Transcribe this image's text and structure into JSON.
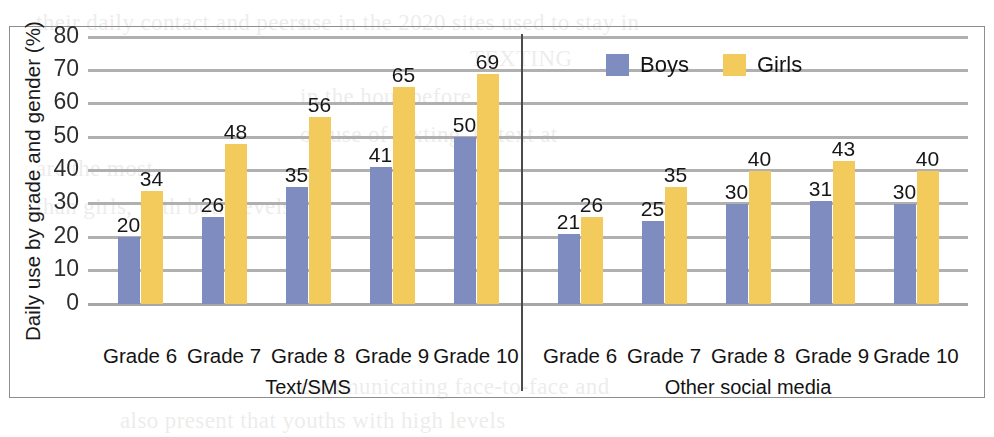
{
  "chart_data": {
    "type": "bar",
    "title": "",
    "xlabel": "",
    "ylabel": "Daily use by grade and gender (%)",
    "ylim": [
      0,
      80
    ],
    "ytick_step": 10,
    "yticks": [
      "80",
      "70",
      "60",
      "50",
      "40",
      "30",
      "20",
      "10",
      "0"
    ],
    "grid": true,
    "legend_position": "top-right",
    "categories": [
      "Grade 6",
      "Grade 7",
      "Grade 8",
      "Grade 9",
      "Grade 10"
    ],
    "panels": [
      {
        "label": "Text/SMS",
        "series": [
          {
            "name": "Boys",
            "color": "#7f8cbf",
            "values": [
              20,
              26,
              35,
              41,
              50
            ]
          },
          {
            "name": "Girls",
            "color": "#f3cb5d",
            "values": [
              34,
              48,
              56,
              65,
              69
            ]
          }
        ]
      },
      {
        "label": "Other social media",
        "series": [
          {
            "name": "Boys",
            "color": "#7f8cbf",
            "values": [
              21,
              25,
              30,
              31,
              30
            ]
          },
          {
            "name": "Girls",
            "color": "#f3cb5d",
            "values": [
              26,
              35,
              40,
              43,
              40
            ]
          }
        ]
      }
    ],
    "series_names": [
      "Boys",
      "Girls"
    ],
    "colors": {
      "boys": "#7f8cbf",
      "girls": "#f3cb5d",
      "gridline": "#a9a9a9",
      "frame": "#8e8e8e",
      "divider": "#4b4b4b"
    }
  },
  "legend": {
    "items": [
      {
        "label": "Boys",
        "swatch": "boys"
      },
      {
        "label": "Girls",
        "swatch": "girls"
      }
    ]
  },
  "background_text": [
    {
      "text": "their daily contact and peers.",
      "x": 36,
      "y": 6
    },
    {
      "text": "use in the 2020 sites used to stay in",
      "x": 300,
      "y": 6
    },
    {
      "text": "TEXTING",
      "x": 470,
      "y": 42
    },
    {
      "text": "in the hour before",
      "x": 300,
      "y": 80
    },
    {
      "text": "on use of texting, to text at",
      "x": 300,
      "y": 118
    },
    {
      "text": "are the most",
      "x": 36,
      "y": 152
    },
    {
      "text": "than girls, with both levels",
      "x": 36,
      "y": 190
    },
    {
      "text": "communicating face-to-face and",
      "x": 300,
      "y": 370
    },
    {
      "text": "also present that youths with high levels",
      "x": 120,
      "y": 404
    }
  ]
}
